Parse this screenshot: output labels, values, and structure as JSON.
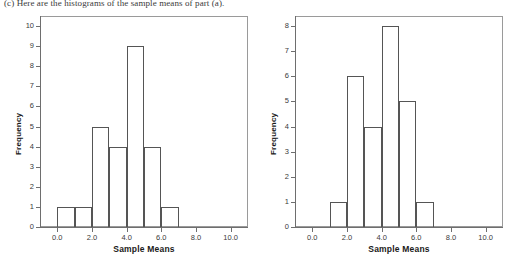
{
  "caption": "(c) Here are the histograms of the sample means of part (a).",
  "chart_data": [
    {
      "type": "bar",
      "name": "left-histogram",
      "title": "",
      "xlabel": "Sample Means",
      "ylabel": "Frequency",
      "xlim": [
        -1.0,
        11.0
      ],
      "ylim": [
        0,
        10.5
      ],
      "grid": false,
      "legend": null,
      "xticks": [
        "0.0",
        "2.0",
        "4.0",
        "6.0",
        "8.0",
        "10.0"
      ],
      "xtick_values": [
        0,
        2,
        4,
        6,
        8,
        10
      ],
      "yticks": [
        "0",
        "1",
        "2",
        "3",
        "4",
        "5",
        "6",
        "7",
        "8",
        "9",
        "10"
      ],
      "ytick_values": [
        0,
        1,
        2,
        3,
        4,
        5,
        6,
        7,
        8,
        9,
        10
      ],
      "bin_edges": [
        0,
        1,
        2,
        3,
        4,
        5,
        6,
        7
      ],
      "categories": [
        "0-1",
        "1-2",
        "2-3",
        "3-4",
        "4-5",
        "5-6",
        "6-7"
      ],
      "values": [
        1,
        1,
        5,
        4,
        9,
        4,
        1
      ]
    },
    {
      "type": "bar",
      "name": "right-histogram",
      "title": "",
      "xlabel": "Sample Means",
      "ylabel": "Frequency",
      "xlim": [
        -1.0,
        11.0
      ],
      "ylim": [
        0,
        8.4
      ],
      "grid": false,
      "legend": null,
      "xticks": [
        "0.0",
        "2.0",
        "4.0",
        "6.0",
        "8.0",
        "10.0"
      ],
      "xtick_values": [
        0,
        2,
        4,
        6,
        8,
        10
      ],
      "yticks": [
        "0",
        "1",
        "2",
        "3",
        "4",
        "5",
        "6",
        "7",
        "8"
      ],
      "ytick_values": [
        0,
        1,
        2,
        3,
        4,
        5,
        6,
        7,
        8
      ],
      "bin_edges": [
        1,
        2,
        3,
        4,
        5,
        6,
        7
      ],
      "categories": [
        "1-2",
        "2-3",
        "3-4",
        "4-5",
        "5-6",
        "6-7"
      ],
      "values": [
        1,
        6,
        4,
        8,
        5,
        1
      ]
    }
  ]
}
